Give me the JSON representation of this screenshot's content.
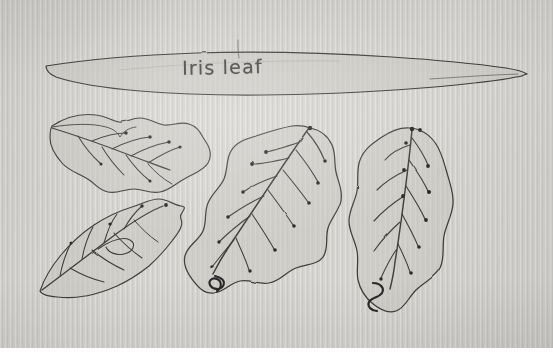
{
  "image": {
    "kind": "photograph-of-paper",
    "subject": "hand-drawn botanical leaf diagrams",
    "paper_color": "#d6d4d0",
    "ink_color": "#3a3a38",
    "leaf_fill_color": "#c9c8c3",
    "margin_color": "#ffffff"
  },
  "annotations": {
    "title_label": "Iris leaf"
  },
  "specimens": [
    {
      "id": "iris-blade",
      "name": "iris-leaf-blade",
      "description": "long narrow tapering blade, pointed at both ends, spanning full sheet width",
      "label": "Iris leaf",
      "vein_type": "parallel",
      "position": "top"
    },
    {
      "id": "leaf-upper-left",
      "name": "broad-leaf-upper-left",
      "description": "broad lobed leaf tilted on its side with pinnate veins and dotted vein tips",
      "vein_type": "pinnate",
      "position": "upper-left"
    },
    {
      "id": "leaf-lower-left",
      "name": "broad-leaf-lower-left",
      "description": "broad leaf angled down-left with pinnate veins and a looping vein",
      "vein_type": "pinnate",
      "position": "lower-left"
    },
    {
      "id": "leaf-center",
      "name": "broad-leaf-center",
      "description": "largest leaf, apex at upper right, pinnate veins with dotted tips and a squiggled petiole",
      "vein_type": "pinnate",
      "position": "center"
    },
    {
      "id": "leaf-right",
      "name": "broad-leaf-right",
      "description": "upright ovate leaf with pinnate veins, dotted tips and a squiggled petiole",
      "vein_type": "pinnate",
      "position": "right"
    }
  ]
}
